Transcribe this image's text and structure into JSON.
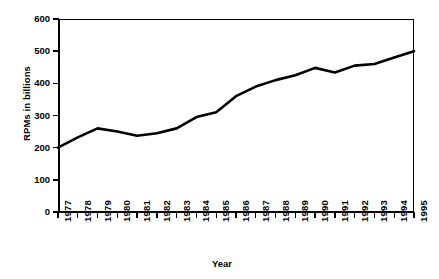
{
  "chart_data": {
    "type": "line",
    "title": "",
    "xlabel": "Year",
    "ylabel": "RPMs in billions",
    "categories": [
      "1977",
      "1978",
      "1979",
      "1980",
      "1981",
      "1982",
      "1983",
      "1984",
      "1985",
      "1986",
      "1987",
      "1988",
      "1989",
      "1990",
      "1991",
      "1992",
      "1993",
      "1994",
      "1995"
    ],
    "x": [
      1977,
      1978,
      1979,
      1980,
      1981,
      1982,
      1983,
      1984,
      1985,
      1986,
      1987,
      1988,
      1989,
      1990,
      1991,
      1992,
      1993,
      1994,
      1995
    ],
    "values": [
      200,
      232,
      260,
      250,
      237,
      245,
      260,
      295,
      310,
      360,
      390,
      410,
      425,
      448,
      434,
      455,
      460,
      480,
      500
    ],
    "series": [
      {
        "name": "RPMs in billions",
        "values": [
          200,
          232,
          260,
          250,
          237,
          245,
          260,
          295,
          310,
          360,
          390,
          410,
          425,
          448,
          434,
          455,
          460,
          480,
          500
        ]
      }
    ],
    "ylim": [
      0,
      600
    ],
    "yticks": [
      0,
      100,
      200,
      300,
      400,
      500,
      600
    ],
    "ytick_labels": [
      "0",
      "100",
      "200",
      "300",
      "400",
      "500",
      "600"
    ],
    "xlim": [
      1977,
      1995
    ],
    "grid": false,
    "legend": false,
    "legend_position": "none",
    "line_color": "#000000",
    "background_color": "#ffffff"
  },
  "axes": {
    "y_title": "RPMs in billions",
    "x_title": "Year"
  }
}
